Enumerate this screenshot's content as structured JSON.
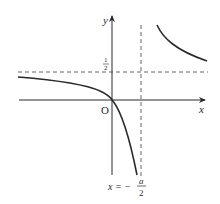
{
  "diagram": {
    "type": "function-graph",
    "axes": {
      "x_label": "x",
      "y_label": "y",
      "origin_label": "O"
    },
    "asymptotes": {
      "horizontal": {
        "label_num": "1",
        "label_den": "2",
        "value": "1/2"
      },
      "vertical": {
        "label_prefix": "x = −",
        "label_num": "a",
        "label_den": "2",
        "value": "-a/2"
      }
    },
    "curve": {
      "description": "hyperbola with two branches; left branch passes through origin",
      "color": "#2a2a2a"
    },
    "colors": {
      "stroke": "#2a2a2a",
      "dashed": "#555555",
      "background": "#ffffff"
    }
  }
}
